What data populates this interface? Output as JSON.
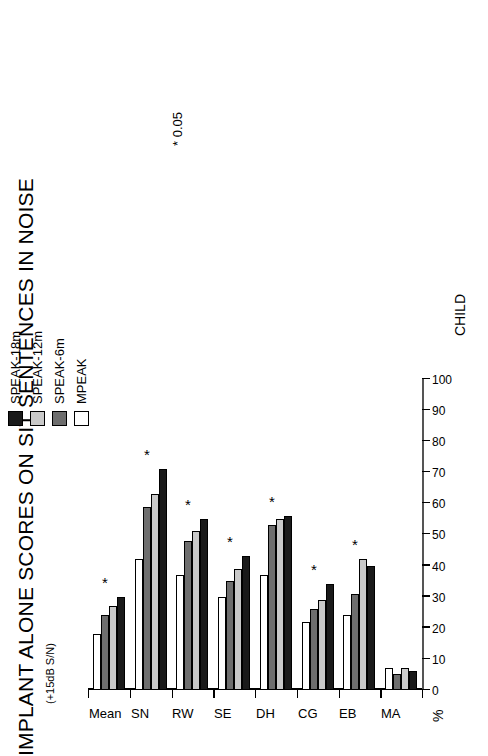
{
  "figure": {
    "title": "IMPLANT ALONE SCORES ON SIT SENTENCES IN NOISE",
    "subtitle": "(+15dB S/N)",
    "significance_note": "*  0.05",
    "value_axis_name": "%",
    "category_axis_name": "CHILD"
  },
  "legend": {
    "position": "top-right",
    "items": [
      {
        "label": "SPEAK-18m",
        "color": "#1a1a1a",
        "swatch": "swatch-speak-18m"
      },
      {
        "label": "SPEAK-12m",
        "color": "#c9c9c9",
        "swatch": "swatch-speak-12m"
      },
      {
        "label": "SPEAK-6m",
        "color": "#6e6e6e",
        "swatch": "swatch-speak-6m"
      },
      {
        "label": "MPEAK",
        "color": "#ffffff",
        "swatch": "swatch-mpeak"
      }
    ]
  },
  "chart_data": {
    "type": "bar",
    "orientation": "horizontal",
    "title": "IMPLANT ALONE SCORES ON SIT SENTENCES IN NOISE",
    "subtitle": "(+15dB S/N)",
    "xlabel": "CHILD",
    "ylabel": "%",
    "ylim": [
      0,
      100
    ],
    "ytick_labels": [
      "0",
      "10",
      "20",
      "30",
      "40",
      "50",
      "60",
      "70",
      "80",
      "90",
      "100"
    ],
    "yticks": [
      0,
      10,
      20,
      30,
      40,
      50,
      60,
      70,
      80,
      90,
      100
    ],
    "grid": false,
    "categories": [
      "MA",
      "EB",
      "CG",
      "DH",
      "SE",
      "RW",
      "SN",
      "Mean"
    ],
    "series": [
      {
        "name": "SPEAK-18m",
        "color": "#1a1a1a",
        "values": [
          6,
          40,
          34,
          56,
          43,
          55,
          71,
          30
        ]
      },
      {
        "name": "SPEAK-12m",
        "color": "#c9c9c9",
        "values": [
          7,
          42,
          29,
          55,
          39,
          51,
          63,
          27
        ]
      },
      {
        "name": "SPEAK-6m",
        "color": "#6e6e6e",
        "values": [
          5,
          31,
          26,
          53,
          35,
          48,
          59,
          24
        ]
      },
      {
        "name": "MPEAK",
        "color": "#ffffff",
        "values": [
          7,
          24,
          22,
          37,
          30,
          37,
          42,
          18
        ]
      }
    ],
    "annotations": [
      {
        "category": "EB",
        "marker": "*"
      },
      {
        "category": "CG",
        "marker": "*"
      },
      {
        "category": "DH",
        "marker": "*"
      },
      {
        "category": "SE",
        "marker": "*"
      },
      {
        "category": "RW",
        "marker": "*"
      },
      {
        "category": "SN",
        "marker": "*"
      },
      {
        "category": "Mean",
        "marker": "*"
      }
    ],
    "note": "*  0.05"
  }
}
